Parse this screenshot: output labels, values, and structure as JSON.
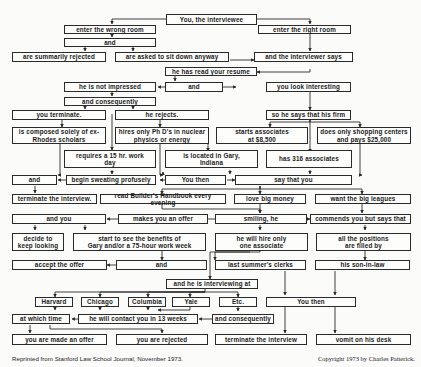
{
  "diagram": {
    "nodes": {
      "root": "You, the interviewee",
      "wrong_room": "enter the wrong room",
      "right_room": "enter the right room",
      "and_1": "and",
      "summarily_rejected": "are summarily rejected",
      "sit_down_anyway": "are asked to sit down anyway",
      "interviewer_says": "and the interviewer says",
      "read_resume": "he has read your resume",
      "not_impressed": "he is not impressed",
      "and_2": "and",
      "look_interesting": "you look interesting",
      "and_consequently_1": "and consequently",
      "you_terminate": "you terminate.",
      "he_rejects": "he rejects.",
      "his_firm": "so he says that his firm",
      "rhodes": "is composed solely of ex-\nRhodes scholars",
      "phds": "hires only Ph D's in nuclear\nphysics or energy",
      "starts_associates": "starts associates\nat $8,500",
      "shopping_centers": "does only shopping centers\nand pays $25,000",
      "work_day": "requires a 15 hr. work\nday",
      "gary": "is located in Gary,\nIndiana",
      "associates_316": "has 316 associates",
      "and_3": "and",
      "sweating": "begin sweating profusely",
      "you_then_1": "You then",
      "say_that_you": "say that you",
      "terminate_interview_1": "terminate the interview.",
      "builders_handbook": "read Builder's Handbook every evening",
      "big_money": "love big money",
      "big_leagues": "want the big leagues",
      "and_you": "and you",
      "makes_offer": "makes you an offer",
      "smiling": "smiling, he",
      "commends": "commends you but says that",
      "keep_looking": "decide to\nkeep looking",
      "benefits_gary": "start to see the benefits of\nGary and/or a 75-hour work week",
      "hire_one": "he will hire only\none associate",
      "positions_filled": "all the positions\nare filled by",
      "accept_offer": "accept the offer",
      "and_4": "and",
      "summer_clerks": "last summer's clerks",
      "son_in_law": "his son-in-law",
      "interviewing_at": "and he is interviewing at",
      "harvard": "Harvard",
      "chicago": "Chicago",
      "columbia": "Columbia",
      "yale": "Yale",
      "etc": "Etc.",
      "you_then_2": "You then",
      "at_which_time": "at which time",
      "contact_13_weeks": "he will contact you in 13 weeks",
      "and_consequently_2": "and consequently",
      "made_offer": "you are made an offer",
      "you_rejected": "you are rejected",
      "terminate_interview_2": "terminate the interview",
      "vomit": "vomit on his desk"
    }
  },
  "footer": {
    "source": "Reprinted from Stanford Law School Journal, November 1973.",
    "copyright": "Copyright 1973 by Charles Patterick."
  },
  "colors": {
    "ink": "#2a2a2a",
    "paper": "#fbfbfa"
  }
}
